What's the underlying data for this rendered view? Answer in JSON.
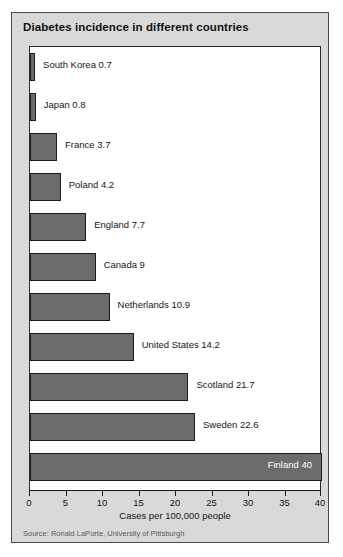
{
  "chart_data": {
    "type": "bar",
    "orientation": "horizontal",
    "title": "Diabetes incidence in different countries",
    "xlabel": "Cases per 100,000 people",
    "ylabel": "",
    "xlim": [
      0,
      40
    ],
    "xticks": [
      0,
      5,
      10,
      15,
      20,
      25,
      30,
      35,
      40
    ],
    "xtick_labels": [
      "0",
      "5",
      "10",
      "15",
      "20",
      "25",
      "30",
      "35",
      "40"
    ],
    "grid": false,
    "legend": null,
    "categories": [
      "South Korea",
      "Japan",
      "France",
      "Poland",
      "England",
      "Canada",
      "Netherlands",
      "United States",
      "Scotland",
      "Sweden",
      "Finland"
    ],
    "values": [
      0.7,
      0.8,
      3.7,
      4.2,
      7.7,
      9,
      10.9,
      14.2,
      21.7,
      22.6,
      40
    ],
    "bars": [
      {
        "label": "South Korea 0.7",
        "category": "South Korea",
        "value": 0.7,
        "label_position": "outside"
      },
      {
        "label": "Japan 0.8",
        "category": "Japan",
        "value": 0.8,
        "label_position": "outside"
      },
      {
        "label": "France 3.7",
        "category": "France",
        "value": 3.7,
        "label_position": "outside"
      },
      {
        "label": "Poland 4.2",
        "category": "Poland",
        "value": 4.2,
        "label_position": "outside"
      },
      {
        "label": "England 7.7",
        "category": "England",
        "value": 7.7,
        "label_position": "outside"
      },
      {
        "label": "Canada 9",
        "category": "Canada",
        "value": 9,
        "label_position": "outside"
      },
      {
        "label": "Netherlands 10.9",
        "category": "Netherlands",
        "value": 10.9,
        "label_position": "outside"
      },
      {
        "label": "United States 14.2",
        "category": "United States",
        "value": 14.2,
        "label_position": "outside"
      },
      {
        "label": "Scotland 21.7",
        "category": "Scotland",
        "value": 21.7,
        "label_position": "outside"
      },
      {
        "label": "Sweden 22.6",
        "category": "Sweden",
        "value": 22.6,
        "label_position": "outside"
      },
      {
        "label": "Finland 40",
        "category": "Finland",
        "value": 40,
        "label_position": "inside"
      }
    ],
    "source": "Source: Ronald LaPorte, University of Pittsburgh",
    "colors": {
      "bar_fill": "#6b6b6b",
      "bar_outline": "#1c1c1c",
      "panel_background": "#d9d9d9",
      "plot_background": "#ffffff",
      "text": "#161616",
      "inside_label_text": "#ffffff",
      "source_text": "#5a5a5a"
    }
  }
}
